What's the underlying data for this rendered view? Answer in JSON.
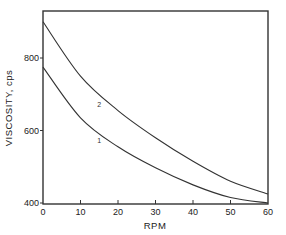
{
  "chart_data": {
    "type": "line",
    "title": "",
    "xlabel": "RPM",
    "ylabel": "VISCOSITY, cps",
    "xlim": [
      0,
      60
    ],
    "ylim": [
      400,
      930
    ],
    "grid": false,
    "legend": "none (curves labeled inline)",
    "x_ticks": [
      0,
      10,
      20,
      30,
      40,
      50,
      60
    ],
    "x_tick_labels": [
      "0",
      "10",
      "20",
      "30",
      "40",
      "50",
      "60"
    ],
    "y_ticks": [
      400,
      600,
      800
    ],
    "y_tick_labels": [
      "400",
      "600",
      "800"
    ],
    "x": [
      0,
      10,
      20,
      30,
      40,
      50,
      60
    ],
    "series": [
      {
        "name": "2",
        "values": [
          900,
          750,
          655,
          580,
          515,
          460,
          425
        ]
      },
      {
        "name": "1",
        "values": [
          775,
          635,
          555,
          497,
          450,
          415,
          400
        ]
      }
    ],
    "annotations": [
      {
        "text": "2",
        "x": 15,
        "y": 665
      },
      {
        "text": "1",
        "x": 15,
        "y": 565
      }
    ]
  }
}
